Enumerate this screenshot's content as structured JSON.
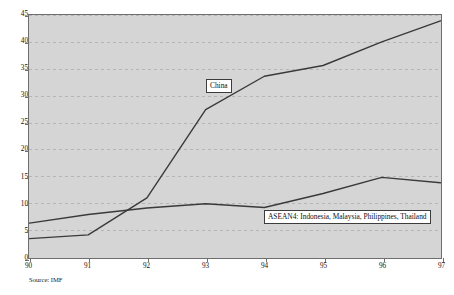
{
  "chart_data": {
    "type": "line",
    "title": "",
    "xlabel": "",
    "ylabel": "",
    "x": [
      "90",
      "91",
      "92",
      "93",
      "94",
      "95",
      "96",
      "97"
    ],
    "xlim": [
      90,
      97
    ],
    "ylim": [
      0,
      45
    ],
    "yticks": [
      0,
      5,
      10,
      15,
      20,
      25,
      30,
      35,
      40,
      45
    ],
    "grid": "horizontal-dashed",
    "legend_position": "inline-labels",
    "series": [
      {
        "name": "China",
        "label": "China",
        "color": "#3a3a3a",
        "values": [
          3.5,
          4.2,
          11.1,
          27.5,
          33.7,
          35.7,
          40.1,
          44.0
        ]
      },
      {
        "name": "ASEAN4",
        "label": "ASEAN4: Indonesia, Malaysia, Philippines, Thailand",
        "color": "#3a3a3a",
        "values": [
          6.4,
          8.0,
          9.2,
          10.0,
          9.3,
          11.9,
          14.9,
          13.9
        ]
      }
    ],
    "annotations": [
      {
        "text": "Source: IMF"
      }
    ]
  },
  "figure": {
    "source_note": "Source: IMF",
    "plot_background": "#d5d5d5",
    "page_background": "#ffffff",
    "line_color": "#3a3a3a",
    "grid_color": "#b4b4b4",
    "axis_color": "#6e6e6e"
  }
}
